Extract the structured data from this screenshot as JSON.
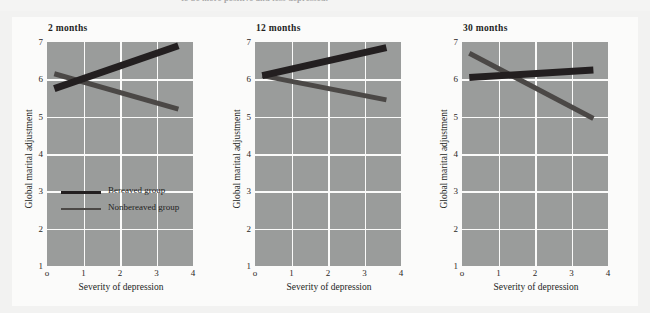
{
  "caption": {
    "text": "to be more positive and less depressed."
  },
  "figure": {
    "x_axis_label": "Severity of depression",
    "y_axis_label": "Global marital adjustment",
    "x_ticks": [
      "o",
      "1",
      "2",
      "3",
      "4"
    ],
    "y_ticks": [
      "7",
      "6",
      "5",
      "4",
      "3",
      "2",
      "1"
    ],
    "legend": {
      "items": [
        {
          "label": "Bereaved group",
          "color": "#231f20",
          "key": "bereaved"
        },
        {
          "label": "Nonbereaved group",
          "color": "#4b4846",
          "key": "nonbereaved"
        }
      ]
    },
    "colors": {
      "plot_background": "#9a9c9b",
      "gridline": "#fbfbfa",
      "card_background": "#fbfbfa",
      "page_background": "#f2f2f1",
      "bereaved_line": "#231f20",
      "nonbereaved_line": "#4b4846",
      "text": "#231f1d"
    },
    "panels": [
      {
        "title": "2 months"
      },
      {
        "title": "12 months"
      },
      {
        "title": "30 months"
      }
    ]
  },
  "chart_data": {
    "type": "line",
    "title": "",
    "xlabel": "Severity of depression",
    "ylabel": "Global marital adjustment",
    "xlim": [
      0,
      4
    ],
    "ylim": [
      1,
      7
    ],
    "grid": true,
    "legend_position": "inside-left-lower (panel 1)",
    "panels": [
      {
        "title": "2 months",
        "series": [
          {
            "name": "Bereaved group",
            "x": [
              0.2,
              3.6
            ],
            "y": [
              5.75,
              6.9
            ]
          },
          {
            "name": "Nonbereaved group",
            "x": [
              0.2,
              3.6
            ],
            "y": [
              6.15,
              5.2
            ]
          }
        ]
      },
      {
        "title": "12 months",
        "series": [
          {
            "name": "Bereaved group",
            "x": [
              0.2,
              3.6
            ],
            "y": [
              6.1,
              6.85
            ]
          },
          {
            "name": "Nonbereaved group",
            "x": [
              0.2,
              3.6
            ],
            "y": [
              6.1,
              5.45
            ]
          }
        ]
      },
      {
        "title": "30 months",
        "series": [
          {
            "name": "Bereaved group",
            "x": [
              0.2,
              3.6
            ],
            "y": [
              6.05,
              6.25
            ]
          },
          {
            "name": "Nonbereaved group",
            "x": [
              0.2,
              3.6
            ],
            "y": [
              6.7,
              4.95
            ]
          }
        ]
      }
    ]
  }
}
